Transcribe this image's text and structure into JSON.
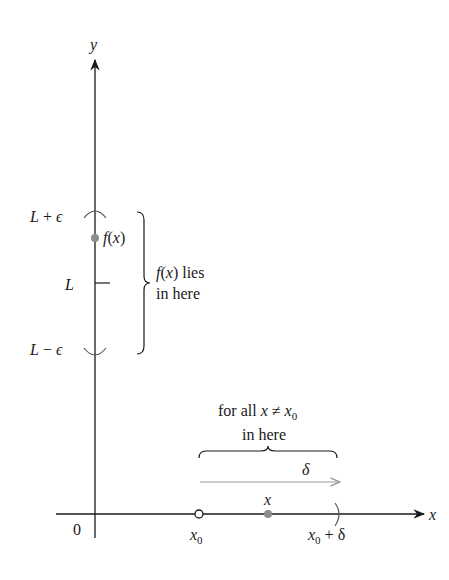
{
  "diagram": {
    "type": "epsilon-delta limit illustration",
    "axes": {
      "x_label": "x",
      "y_label": "y",
      "origin_label": "0"
    },
    "y_labels": {
      "upper": "L + ε",
      "center": "L",
      "lower": "L − ε"
    },
    "fx_point_label": "f(x)",
    "y_brace_text": [
      "f(x) lies",
      "in here"
    ],
    "x_brace_text": [
      "for all x ≠ x",
      "in here"
    ],
    "x_brace_sub": "0",
    "delta_label": "δ",
    "x_points": {
      "x0_label": "x",
      "x0_sub": "0",
      "x_label": "x",
      "x0_plus_delta": {
        "base": "x",
        "sub": "0",
        "rest": " + δ"
      }
    },
    "colors": {
      "axis": "#1a1a1a",
      "point_gray": "#8c8c8c",
      "delta_arrow": "#9a9a9a",
      "interval_marks": "#555555"
    }
  }
}
